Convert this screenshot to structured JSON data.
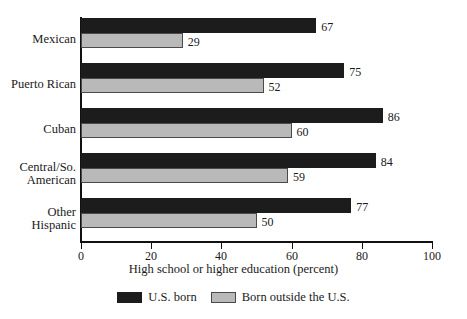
{
  "chart_data": {
    "type": "bar",
    "orientation": "horizontal",
    "title": "",
    "xlabel": "High school or higher education (percent)",
    "ylabel": "",
    "xlim": [
      0,
      100
    ],
    "xticks": [
      0,
      20,
      40,
      60,
      80,
      100
    ],
    "grid": false,
    "legend_position": "bottom",
    "categories": [
      "Mexican",
      "Puerto Rican",
      "Cuban",
      "Central/So.\nAmerican",
      "Other\nHispanic"
    ],
    "series": [
      {
        "name": "U.S. born",
        "color": "#1c1c1c",
        "values": [
          67,
          75,
          86,
          84,
          77
        ]
      },
      {
        "name": "Born outside the U.S.",
        "color": "#b9b9b9",
        "values": [
          29,
          52,
          60,
          59,
          50
        ]
      }
    ]
  },
  "legend": {
    "items": [
      {
        "label": "U.S. born",
        "swatch": "dark"
      },
      {
        "label": "Born outside the U.S.",
        "swatch": "light"
      }
    ]
  }
}
